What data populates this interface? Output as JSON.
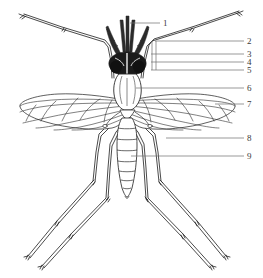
{
  "figure": {
    "kind": "anatomical-line-drawing",
    "view": "dorsal",
    "background_color": "#ffffff",
    "ink_color": "#2b2b2b",
    "label_color": "#3a3a3a",
    "width": 263,
    "height": 278
  },
  "labels": [
    {
      "id": "1",
      "text": "1",
      "x": 163,
      "y": 19,
      "leader_from_x": 130,
      "leader_from_y": 23,
      "leader_to_x": 160,
      "leader_to_y": 23
    },
    {
      "id": "2",
      "text": "2",
      "x": 247,
      "y": 37,
      "leader_from_x": 155,
      "leader_from_y": 41,
      "leader_to_x": 244,
      "leader_to_y": 41
    },
    {
      "id": "3",
      "text": "3",
      "x": 247,
      "y": 50,
      "leader_from_x": 151,
      "leader_from_y": 54,
      "leader_to_x": 244,
      "leader_to_y": 54
    },
    {
      "id": "4",
      "text": "4",
      "x": 247,
      "y": 58,
      "leader_from_x": 151,
      "leader_from_y": 62,
      "leader_to_x": 244,
      "leader_to_y": 62
    },
    {
      "id": "5",
      "text": "5",
      "x": 247,
      "y": 66,
      "leader_from_x": 151,
      "leader_from_y": 70,
      "leader_to_x": 244,
      "leader_to_y": 70
    },
    {
      "id": "6",
      "text": "6",
      "x": 247,
      "y": 84,
      "leader_from_x": 136,
      "leader_from_y": 88,
      "leader_to_x": 244,
      "leader_to_y": 88
    },
    {
      "id": "7",
      "text": "7",
      "x": 247,
      "y": 100,
      "leader_from_x": 215,
      "leader_from_y": 104,
      "leader_to_x": 244,
      "leader_to_y": 104
    },
    {
      "id": "8",
      "text": "8",
      "x": 247,
      "y": 134,
      "leader_from_x": 166,
      "leader_from_y": 138,
      "leader_to_x": 244,
      "leader_to_y": 138
    },
    {
      "id": "9",
      "text": "9",
      "x": 247,
      "y": 152,
      "leader_from_x": 131,
      "leader_from_y": 156,
      "leader_to_x": 244,
      "leader_to_y": 156
    }
  ],
  "anatomy": {
    "proboscis": "proboscis",
    "maxillary_palps": "maxillary-palps",
    "antennae": "antennae",
    "compound_eyes": "compound-eyes",
    "head": "head",
    "thorax": "thorax",
    "scutum": "scutum",
    "wings": "wings",
    "halteres": "halteres",
    "abdomen": "abdomen",
    "abdominal_segments": 8,
    "legs": "legs",
    "leg_pairs": 3
  }
}
